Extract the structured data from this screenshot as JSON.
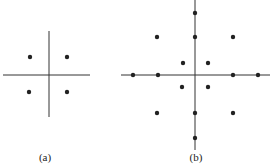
{
  "panels": [
    {
      "label": "(a)",
      "axes": {
        "h": [
          3,
          90,
          75
        ],
        "v": [
          49,
          31,
          117
        ]
      },
      "points": [
        [
          30,
          57
        ],
        [
          67,
          57
        ],
        [
          29,
          92
        ],
        [
          67,
          92
        ]
      ],
      "label_pos": [
        45,
        152
      ]
    },
    {
      "label": "(b)",
      "axes": {
        "h": [
          121,
          270,
          75
        ],
        "v": [
          195,
          0,
          150
        ]
      },
      "points": [
        [
          195,
          13
        ],
        [
          157,
          37
        ],
        [
          195,
          37
        ],
        [
          233,
          37
        ],
        [
          183,
          63
        ],
        [
          208,
          63
        ],
        [
          133,
          75
        ],
        [
          158,
          75
        ],
        [
          233,
          75
        ],
        [
          258,
          75
        ],
        [
          182,
          87
        ],
        [
          208,
          87
        ],
        [
          157,
          113
        ],
        [
          195,
          113
        ],
        [
          233,
          113
        ],
        [
          195,
          138
        ]
      ],
      "label_pos": [
        196,
        152
      ]
    }
  ],
  "colors": {
    "line": "#333333",
    "dot": "#222222"
  }
}
